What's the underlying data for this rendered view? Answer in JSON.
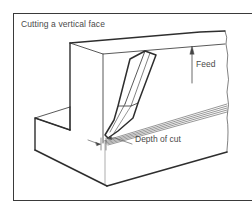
{
  "figure": {
    "caption": "Cutting a vertical face",
    "labels": {
      "feed": "Feed",
      "depth_of_cut": "Depth of cut"
    },
    "elements": {
      "workpiece": "stepped-block",
      "tool": "single-point-cutting-tool",
      "feed_arrow": "arrow-up",
      "depth_dimension": "dimension-arrows"
    },
    "colors": {
      "line": "#2e2e2e",
      "text": "#4a4a4a",
      "frame": "#3a3a3a",
      "background": "#ffffff"
    }
  }
}
